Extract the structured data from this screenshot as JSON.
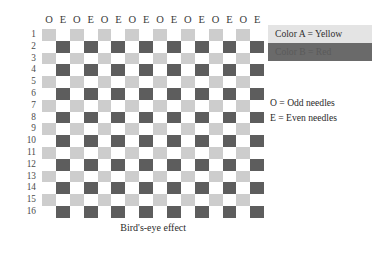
{
  "caption": "Bird's-eye effect",
  "legend": {
    "color_a": "Color A = Yellow",
    "color_b": "Color B = Red",
    "color_a_bg": "#e4e4e4",
    "color_b_bg": "#6a6a6a",
    "key_odd": "O = Odd needles",
    "key_even": "E = Even needles"
  },
  "chart_data": {
    "type": "heatmap",
    "title": "Bird's-eye effect",
    "xlabel": "",
    "ylabel": "",
    "grid": true,
    "legend_position": "right",
    "column_headers": [
      "O",
      "E",
      "O",
      "E",
      "O",
      "E",
      "O",
      "E",
      "O",
      "E",
      "O",
      "E",
      "O",
      "E",
      "O",
      "E"
    ],
    "row_labels": [
      "1",
      "2",
      "3",
      "4",
      "5",
      "6",
      "7",
      "8",
      "9",
      "10",
      "11",
      "12",
      "13",
      "14",
      "15",
      "16"
    ],
    "cell_colors": {
      "empty": "#ffffff",
      "light": "#cdcdcd",
      "dark": "#5d5d5d"
    },
    "cell_legend": {
      "light": "Color A = Yellow",
      "dark": "Color B = Red",
      "empty": "no stitch"
    },
    "rows": [
      [
        "light",
        "empty",
        "light",
        "empty",
        "light",
        "empty",
        "light",
        "empty",
        "light",
        "empty",
        "light",
        "empty",
        "light",
        "empty",
        "light",
        "empty"
      ],
      [
        "empty",
        "dark",
        "empty",
        "dark",
        "empty",
        "dark",
        "empty",
        "dark",
        "empty",
        "dark",
        "empty",
        "dark",
        "empty",
        "dark",
        "empty",
        "dark"
      ],
      [
        "light",
        "empty",
        "light",
        "empty",
        "light",
        "empty",
        "light",
        "empty",
        "light",
        "empty",
        "light",
        "empty",
        "light",
        "empty",
        "light",
        "empty"
      ],
      [
        "empty",
        "dark",
        "empty",
        "dark",
        "empty",
        "dark",
        "empty",
        "dark",
        "empty",
        "dark",
        "empty",
        "dark",
        "empty",
        "dark",
        "empty",
        "dark"
      ],
      [
        "light",
        "empty",
        "light",
        "empty",
        "light",
        "empty",
        "light",
        "empty",
        "light",
        "empty",
        "light",
        "empty",
        "light",
        "empty",
        "light",
        "empty"
      ],
      [
        "empty",
        "dark",
        "empty",
        "dark",
        "empty",
        "dark",
        "empty",
        "dark",
        "empty",
        "dark",
        "empty",
        "dark",
        "empty",
        "dark",
        "empty",
        "dark"
      ],
      [
        "light",
        "empty",
        "light",
        "empty",
        "light",
        "empty",
        "light",
        "empty",
        "light",
        "empty",
        "light",
        "empty",
        "light",
        "empty",
        "light",
        "empty"
      ],
      [
        "empty",
        "dark",
        "empty",
        "dark",
        "empty",
        "dark",
        "empty",
        "dark",
        "empty",
        "dark",
        "empty",
        "dark",
        "empty",
        "dark",
        "empty",
        "dark"
      ],
      [
        "light",
        "empty",
        "light",
        "empty",
        "light",
        "empty",
        "light",
        "empty",
        "light",
        "empty",
        "light",
        "empty",
        "light",
        "empty",
        "light",
        "empty"
      ],
      [
        "empty",
        "dark",
        "empty",
        "dark",
        "empty",
        "dark",
        "empty",
        "dark",
        "empty",
        "dark",
        "empty",
        "dark",
        "empty",
        "dark",
        "empty",
        "dark"
      ],
      [
        "light",
        "empty",
        "light",
        "empty",
        "light",
        "empty",
        "light",
        "empty",
        "light",
        "empty",
        "light",
        "empty",
        "light",
        "empty",
        "light",
        "empty"
      ],
      [
        "empty",
        "dark",
        "empty",
        "dark",
        "empty",
        "dark",
        "empty",
        "dark",
        "empty",
        "dark",
        "empty",
        "dark",
        "empty",
        "dark",
        "empty",
        "dark"
      ],
      [
        "light",
        "empty",
        "light",
        "empty",
        "light",
        "empty",
        "light",
        "empty",
        "light",
        "empty",
        "light",
        "empty",
        "light",
        "empty",
        "light",
        "empty"
      ],
      [
        "empty",
        "dark",
        "empty",
        "dark",
        "empty",
        "dark",
        "empty",
        "dark",
        "empty",
        "dark",
        "empty",
        "dark",
        "empty",
        "dark",
        "empty",
        "dark"
      ],
      [
        "light",
        "empty",
        "light",
        "empty",
        "light",
        "empty",
        "light",
        "empty",
        "light",
        "empty",
        "light",
        "empty",
        "light",
        "empty",
        "light",
        "empty"
      ],
      [
        "empty",
        "dark",
        "empty",
        "dark",
        "empty",
        "dark",
        "empty",
        "dark",
        "empty",
        "dark",
        "empty",
        "dark",
        "empty",
        "dark",
        "empty",
        "dark"
      ]
    ]
  }
}
